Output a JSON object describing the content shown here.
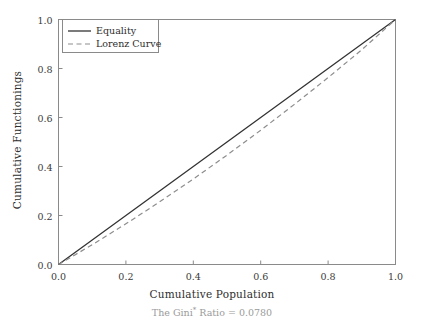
{
  "chart_data": {
    "type": "line",
    "title": "",
    "subtitle": "The Gini* Ratio = 0.0780",
    "subtitle_prefix": "The Gini",
    "subtitle_superscript": "*",
    "subtitle_suffix": " Ratio = 0.0780",
    "gini_ratio": 0.078,
    "xlabel": "Cumulative Population",
    "ylabel": "Cumulative Functionings",
    "xlim": [
      0.0,
      1.0
    ],
    "ylim": [
      0.0,
      1.0
    ],
    "grid": false,
    "legend_position": "upper left",
    "xticks": [
      "0.0",
      "0.2",
      "0.4",
      "0.6",
      "0.8",
      "1.0"
    ],
    "xtick_values": [
      0.0,
      0.2,
      0.4,
      0.6,
      0.8,
      1.0
    ],
    "yticks": [
      "0.0",
      "0.2",
      "0.4",
      "0.6",
      "0.8",
      "1.0"
    ],
    "ytick_values": [
      0.0,
      0.2,
      0.4,
      0.6,
      0.8,
      1.0
    ],
    "series": [
      {
        "name": "Equality",
        "style": "solid",
        "color": "#333333",
        "x": [
          0.0,
          0.1,
          0.2,
          0.3,
          0.4,
          0.5,
          0.6,
          0.7,
          0.8,
          0.9,
          1.0
        ],
        "values": [
          0.0,
          0.1,
          0.2,
          0.3,
          0.4,
          0.5,
          0.6,
          0.7,
          0.8,
          0.9,
          1.0
        ]
      },
      {
        "name": "Lorenz Curve",
        "style": "dashed",
        "color": "#8d8d8d",
        "x": [
          0.0,
          0.1,
          0.2,
          0.3,
          0.4,
          0.5,
          0.6,
          0.7,
          0.8,
          0.9,
          1.0
        ],
        "values": [
          0.0,
          0.0805,
          0.166,
          0.2555,
          0.349,
          0.4465,
          0.548,
          0.6535,
          0.763,
          0.8765,
          1.0
        ]
      }
    ]
  },
  "legend": {
    "items": [
      {
        "label": "Equality"
      },
      {
        "label": "Lorenz Curve"
      }
    ]
  }
}
